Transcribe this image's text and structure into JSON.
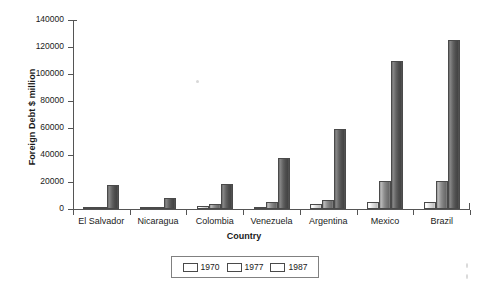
{
  "chart_data": {
    "type": "bar",
    "title": "",
    "xlabel": "Country",
    "ylabel": "Foreign Debt $ million",
    "categories": [
      "El Salvador",
      "Nicaragua",
      "Colombia",
      "Venezuela",
      "Argentina",
      "Mexico",
      "Brazil"
    ],
    "series": [
      {
        "name": "1970",
        "color": "#dcdcdc",
        "values": [
          100,
          150,
          1900,
          1000,
          3800,
          5500,
          5500
        ]
      },
      {
        "name": "1977",
        "color": "#8b8b8b",
        "values": [
          1000,
          1200,
          3800,
          5500,
          7000,
          21000,
          21000
        ]
      },
      {
        "name": "1987",
        "color": "#5a5a5a",
        "values": [
          17500,
          8500,
          18500,
          38000,
          59000,
          110000,
          125500
        ]
      }
    ],
    "ylim": [
      0,
      140000
    ],
    "yticks": [
      0,
      20000,
      40000,
      60000,
      80000,
      100000,
      120000,
      140000
    ],
    "ytick_labels": [
      "0",
      "20000",
      "40000",
      "60000",
      "80000",
      "100000",
      "120000",
      "140000"
    ],
    "grid": false,
    "legend_position": "bottom-center"
  },
  "legend": {
    "entries": [
      {
        "label": "1970"
      },
      {
        "label": "1977"
      },
      {
        "label": "1987"
      }
    ]
  }
}
